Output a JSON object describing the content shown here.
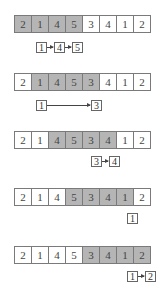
{
  "colors": {
    "highlight": "#b5b5b5",
    "border": "#7a7a7a",
    "background": "#ffffff"
  },
  "array": [
    2,
    1,
    4,
    5,
    3,
    4,
    1,
    2
  ],
  "steps": [
    {
      "row_top": 15,
      "window": [
        0,
        3
      ],
      "cells": [
        "2",
        "1",
        "4",
        "5",
        "3",
        "4",
        "1",
        "2"
      ],
      "chain_top": 42,
      "chain": [
        {
          "label": "1",
          "x": 36
        },
        {
          "label": "4",
          "x": 54
        },
        {
          "label": "5",
          "x": 72
        }
      ]
    },
    {
      "row_top": 73,
      "window": [
        1,
        4
      ],
      "cells": [
        "2",
        "1",
        "4",
        "5",
        "3",
        "4",
        "1",
        "2"
      ],
      "chain_top": 100,
      "chain": [
        {
          "label": "1",
          "x": 36
        },
        {
          "label": "3",
          "x": 91
        }
      ]
    },
    {
      "row_top": 131,
      "window": [
        2,
        5
      ],
      "cells": [
        "2",
        "1",
        "4",
        "5",
        "3",
        "4",
        "1",
        "2"
      ],
      "chain_top": 156,
      "chain": [
        {
          "label": "3",
          "x": 91
        },
        {
          "label": "4",
          "x": 109
        }
      ]
    },
    {
      "row_top": 188,
      "window": [
        3,
        6
      ],
      "cells": [
        "2",
        "1",
        "4",
        "5",
        "3",
        "4",
        "1",
        "2"
      ],
      "chain_top": 213,
      "chain": [
        {
          "label": "1",
          "x": 127
        }
      ]
    },
    {
      "row_top": 246,
      "window": [
        4,
        7
      ],
      "cells": [
        "2",
        "1",
        "4",
        "5",
        "3",
        "4",
        "1",
        "2"
      ],
      "chain_top": 271,
      "chain": [
        {
          "label": "1",
          "x": 127
        },
        {
          "label": "2",
          "x": 145
        }
      ]
    }
  ]
}
